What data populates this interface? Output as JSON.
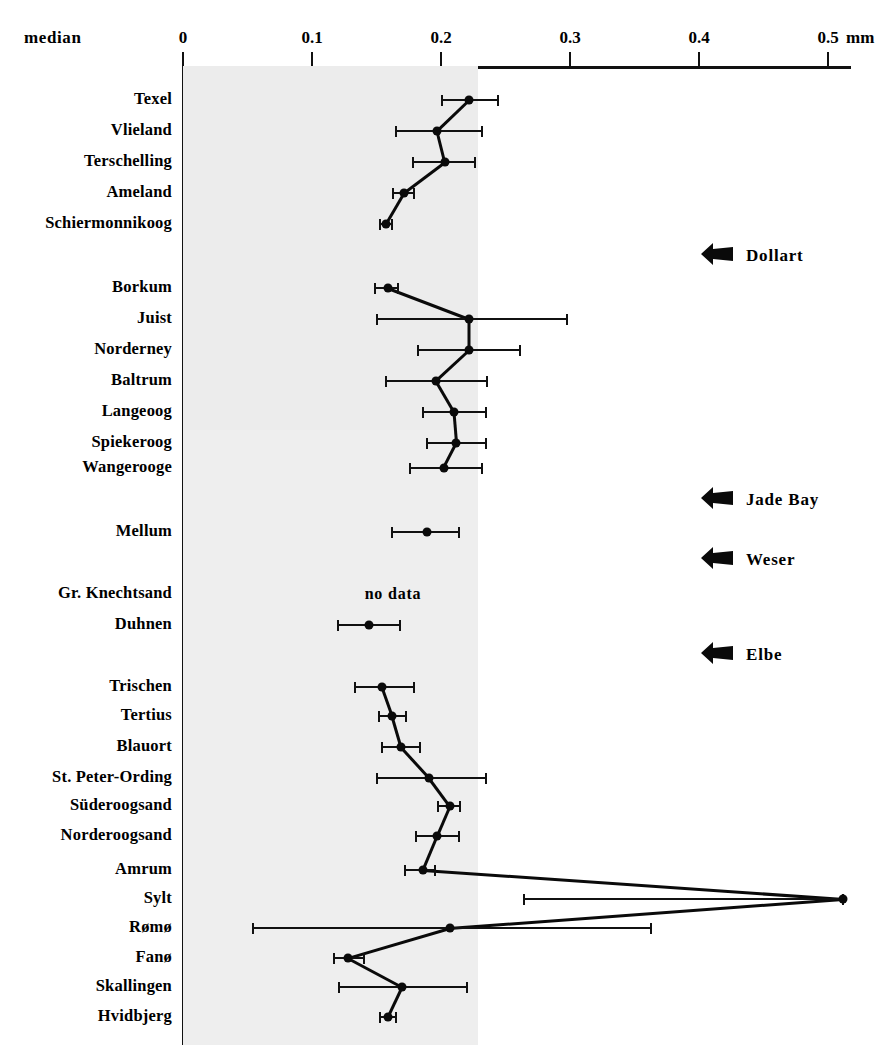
{
  "header": {
    "median_label": "median",
    "unit": "mm",
    "tick_labels": [
      "0",
      "0.1",
      "0.2",
      "0.3",
      "0.4",
      "0.5"
    ]
  },
  "annotations": [
    {
      "label": "Dollart",
      "icon": "left-arrow-icon"
    },
    {
      "label": "Jade Bay",
      "icon": "left-arrow-icon"
    },
    {
      "label": "Weser",
      "icon": "left-arrow-icon"
    },
    {
      "label": "Elbe",
      "icon": "left-arrow-icon"
    }
  ],
  "no_data_text": "no data",
  "colors": {
    "ink": "#0a0a0a",
    "shade": "#ececec",
    "background": "#ffffff"
  },
  "chart_data": {
    "type": "scatter",
    "orientation": "horizontal",
    "title": "median",
    "xlabel": "mm",
    "ylabel": "",
    "xlim": [
      0,
      0.52
    ],
    "xticks": [
      0,
      0.1,
      0.2,
      0.3,
      0.4,
      0.5
    ],
    "grid": false,
    "legend": false,
    "error_bars": "horizontal",
    "connected": true,
    "categories": [
      "Texel",
      "Vlieland",
      "Terschelling",
      "Ameland",
      "Schiermonnikoog",
      "Borkum",
      "Juist",
      "Norderney",
      "Baltrum",
      "Langeoog",
      "Spiekeroog",
      "Wangerooge",
      "Mellum",
      "Gr. Knechtsand",
      "Duhnen",
      "Trischen",
      "Tertius",
      "Blauort",
      "St. Peter-Ording",
      "Süderoogsand",
      "Norderoogsand",
      "Amrum",
      "Sylt",
      "Rømø",
      "Fanø",
      "Skallingen",
      "Hvidbjerg"
    ],
    "series": [
      {
        "name": "median grain size",
        "unit": "mm",
        "points": [
          {
            "label": "Texel",
            "value": 0.222,
            "low": 0.201,
            "high": 0.244,
            "group": 1
          },
          {
            "label": "Vlieland",
            "value": 0.197,
            "low": 0.165,
            "high": 0.232,
            "group": 1
          },
          {
            "label": "Terschelling",
            "value": 0.203,
            "low": 0.178,
            "high": 0.226,
            "group": 1
          },
          {
            "label": "Ameland",
            "value": 0.171,
            "low": 0.163,
            "high": 0.179,
            "group": 1
          },
          {
            "label": "Schiermonnikoog",
            "value": 0.157,
            "low": 0.153,
            "high": 0.162,
            "group": 1
          },
          {
            "label": "Borkum",
            "value": 0.159,
            "low": 0.149,
            "high": 0.167,
            "group": 2
          },
          {
            "label": "Juist",
            "value": 0.222,
            "low": 0.15,
            "high": 0.298,
            "group": 2
          },
          {
            "label": "Norderney",
            "value": 0.222,
            "low": 0.182,
            "high": 0.261,
            "group": 2
          },
          {
            "label": "Baltrum",
            "value": 0.196,
            "low": 0.157,
            "high": 0.236,
            "group": 2
          },
          {
            "label": "Langeoog",
            "value": 0.21,
            "low": 0.186,
            "high": 0.235,
            "group": 2
          },
          {
            "label": "Spiekeroog",
            "value": 0.212,
            "low": 0.189,
            "high": 0.235,
            "group": 2
          },
          {
            "label": "Wangerooge",
            "value": 0.202,
            "low": 0.176,
            "high": 0.232,
            "group": 2
          },
          {
            "label": "Mellum",
            "value": 0.189,
            "low": 0.162,
            "high": 0.214,
            "group": 3
          },
          {
            "label": "Gr. Knechtsand",
            "value": null,
            "low": null,
            "high": null,
            "group": 4,
            "note": "no data"
          },
          {
            "label": "Duhnen",
            "value": 0.144,
            "low": 0.12,
            "high": 0.168,
            "group": 4
          },
          {
            "label": "Trischen",
            "value": 0.154,
            "low": 0.133,
            "high": 0.179,
            "group": 5
          },
          {
            "label": "Tertius",
            "value": 0.162,
            "low": 0.152,
            "high": 0.173,
            "group": 5
          },
          {
            "label": "Blauort",
            "value": 0.169,
            "low": 0.154,
            "high": 0.184,
            "group": 5
          },
          {
            "label": "St. Peter-Ording",
            "value": 0.191,
            "low": 0.15,
            "high": 0.235,
            "group": 5
          },
          {
            "label": "Süderoogsand",
            "value": 0.207,
            "low": 0.198,
            "high": 0.215,
            "group": 5
          },
          {
            "label": "Norderoogsand",
            "value": 0.197,
            "low": 0.181,
            "high": 0.214,
            "group": 5
          },
          {
            "label": "Amrum",
            "value": 0.186,
            "low": 0.172,
            "high": 0.195,
            "group": 5
          },
          {
            "label": "Sylt",
            "value": 0.512,
            "low": 0.264,
            "high": 0.512,
            "group": 5
          },
          {
            "label": "Rømø",
            "value": 0.207,
            "low": 0.054,
            "high": 0.363,
            "group": 5
          },
          {
            "label": "Fanø",
            "value": 0.128,
            "low": 0.117,
            "high": 0.14,
            "group": 5
          },
          {
            "label": "Skallingen",
            "value": 0.17,
            "low": 0.121,
            "high": 0.22,
            "group": 5
          },
          {
            "label": "Hvidbjerg",
            "value": 0.159,
            "low": 0.153,
            "high": 0.165,
            "group": 5
          }
        ]
      }
    ]
  },
  "geometry": {
    "x0": 183,
    "x_per_unit": 1290,
    "axis_y": 66,
    "plot_top": 66,
    "plot_bottom": 1045,
    "row_y": [
      100,
      131,
      162,
      193,
      224,
      288,
      319,
      350,
      381,
      412,
      443,
      468,
      532,
      594,
      625,
      687,
      716,
      747,
      778,
      806,
      836,
      870,
      899,
      928,
      958,
      987,
      1017
    ],
    "shade_steps": [
      {
        "to_value": 0.229,
        "y0": 66,
        "y1": 430
      },
      {
        "to_value": 0.229,
        "y0": 430,
        "y1": 1045
      }
    ],
    "annotation_y": [
      255,
      499,
      559,
      654
    ],
    "annotation_x": 700,
    "nodata_x": 393,
    "nodata_y": 594
  }
}
